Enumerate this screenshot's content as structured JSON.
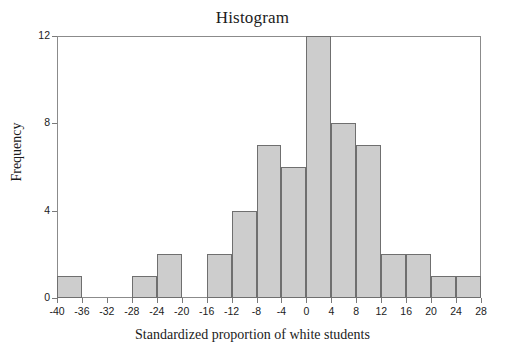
{
  "chart_data": {
    "type": "bar",
    "title": "Histogram",
    "xlabel": "Standardized proportion of white students",
    "ylabel": "Frequency",
    "bin_width": 4,
    "bin_edges": [
      -40,
      -36,
      -32,
      -28,
      -24,
      -20,
      -16,
      -12,
      -8,
      -4,
      0,
      4,
      8,
      12,
      16,
      20,
      24,
      28
    ],
    "categories": [
      "-40 to -36",
      "-36 to -32",
      "-32 to -28",
      "-28 to -24",
      "-24 to -20",
      "-20 to -16",
      "-16 to -12",
      "-12 to -8",
      "-8 to -4",
      "-4 to 0",
      "0 to 4",
      "4 to 8",
      "8 to 12",
      "12 to 16",
      "16 to 20",
      "20 to 24",
      "24 to 28"
    ],
    "values": [
      1,
      0,
      0,
      1,
      2,
      0,
      2,
      4,
      7,
      6,
      12,
      8,
      7,
      2,
      2,
      1,
      1
    ],
    "xlim": [
      -40,
      28
    ],
    "ylim": [
      0,
      12
    ],
    "xticks": [
      -40,
      -36,
      -32,
      -28,
      -24,
      -20,
      -16,
      -12,
      -8,
      -4,
      0,
      4,
      8,
      12,
      16,
      20,
      24,
      28
    ],
    "xtick_labels": [
      "-40",
      "-36",
      "-32",
      "-28",
      "-24",
      "-20",
      "-16",
      "-12",
      "-8",
      "-4",
      "0",
      "4",
      "8",
      "12",
      "16",
      "20",
      "24",
      "28"
    ],
    "yticks": [
      0,
      4,
      8,
      12
    ],
    "ytick_labels": [
      "0",
      "4",
      "8",
      "12"
    ],
    "grid": false,
    "legend": false,
    "total_count": 48,
    "colors": {
      "bar_fill": "#cdcdcd",
      "bar_edge": "#6f6f6f",
      "axis": "#8b8b8b",
      "text": "#1b1b1b",
      "background": "#ffffff"
    }
  }
}
